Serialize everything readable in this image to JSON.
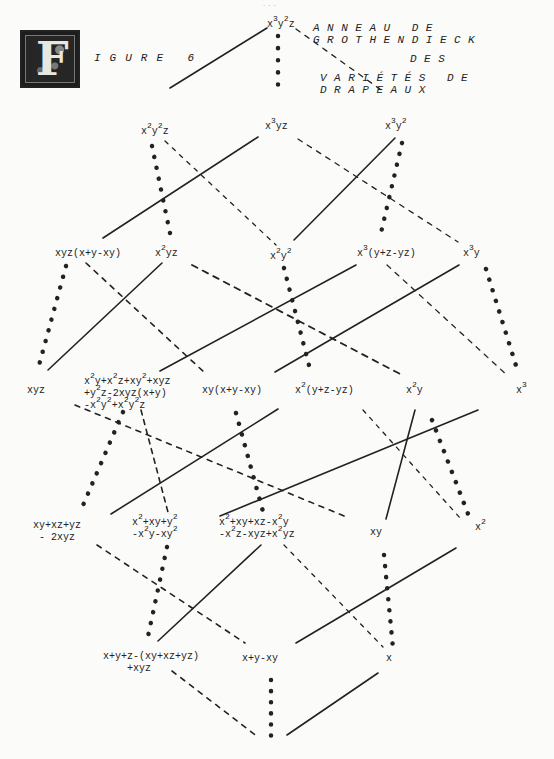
{
  "page_number": "...",
  "figure": {
    "initial_letter": "F",
    "label": "IGURE 6",
    "title_lines": [
      "ANNEAU DE GROTHENDIECK",
      "DES",
      "VARIÉTÉS DE DRAPEAUX"
    ]
  },
  "legend_styles": {
    "solid": "solid line",
    "dashed": "dashed line",
    "starred": "star-dotted line"
  },
  "nodes": [
    {
      "id": "n0",
      "row": 0,
      "label": "x³y²z"
    },
    {
      "id": "n1a",
      "row": 1,
      "label": "x²y²z"
    },
    {
      "id": "n1b",
      "row": 1,
      "label": "x³yz"
    },
    {
      "id": "n1c",
      "row": 1,
      "label": "x³y²"
    },
    {
      "id": "n2a",
      "row": 2,
      "label": "xyz(x+y-xy)"
    },
    {
      "id": "n2b",
      "row": 2,
      "label": "x²yz"
    },
    {
      "id": "n2c",
      "row": 2,
      "label": "x²y²"
    },
    {
      "id": "n2d",
      "row": 2,
      "label": "x³(y+z-yz)"
    },
    {
      "id": "n2e",
      "row": 2,
      "label": "x³y"
    },
    {
      "id": "n3a",
      "row": 3,
      "label": "xyz"
    },
    {
      "id": "n3b",
      "row": 3,
      "label": "x²y+x²z+xy²+xyz +y²z-2xyz(x+y) -x²y²+x²y²z"
    },
    {
      "id": "n3c",
      "row": 3,
      "label": "xy(x+y-xy)"
    },
    {
      "id": "n3d",
      "row": 3,
      "label": "x²(y+z-yz)"
    },
    {
      "id": "n3e",
      "row": 3,
      "label": "x²y"
    },
    {
      "id": "n3f",
      "row": 3,
      "label": "x³"
    },
    {
      "id": "n4a",
      "row": 4,
      "label": "xy+xz+yz - 2xyz"
    },
    {
      "id": "n4b",
      "row": 4,
      "label": "x²+xy+y² -x²y-xy²"
    },
    {
      "id": "n4c",
      "row": 4,
      "label": "x²+xy+xz-x²y -x²z-xyz+x²yz"
    },
    {
      "id": "n4d",
      "row": 4,
      "label": "xy"
    },
    {
      "id": "n4e",
      "row": 4,
      "label": "x²"
    },
    {
      "id": "n5a",
      "row": 5,
      "label": "x+y+z-(xy+xz+yz) +xyz"
    },
    {
      "id": "n5b",
      "row": 5,
      "label": "x+y-xy"
    },
    {
      "id": "n5c",
      "row": 5,
      "label": "x"
    },
    {
      "id": "n6",
      "row": 6,
      "label": ""
    }
  ],
  "edges": [
    {
      "from": "n0",
      "to": "n1a",
      "style": "solid"
    },
    {
      "from": "n0",
      "to": "n1b",
      "style": "starred"
    },
    {
      "from": "n0",
      "to": "n1c",
      "style": "dashed"
    },
    {
      "from": "n1a",
      "to": "n2b",
      "style": "starred"
    },
    {
      "from": "n1a",
      "to": "n2c",
      "style": "dashed"
    },
    {
      "from": "n1b",
      "to": "n2a",
      "style": "solid"
    },
    {
      "from": "n1b",
      "to": "n2e",
      "style": "dashed"
    },
    {
      "from": "n1c",
      "to": "n2c",
      "style": "solid"
    },
    {
      "from": "n1c",
      "to": "n2d",
      "style": "starred"
    },
    {
      "from": "n2a",
      "to": "n3a",
      "style": "starred"
    },
    {
      "from": "n2a",
      "to": "n3c",
      "style": "dashed"
    },
    {
      "from": "n2b",
      "to": "n3a",
      "style": "solid"
    },
    {
      "from": "n2b",
      "to": "n3e",
      "style": "dashed"
    },
    {
      "from": "n2c",
      "to": "n3d",
      "style": "starred"
    },
    {
      "from": "n2d",
      "to": "n3b",
      "style": "solid"
    },
    {
      "from": "n2d",
      "to": "n3f",
      "style": "dashed"
    },
    {
      "from": "n2e",
      "to": "n3d",
      "style": "solid"
    },
    {
      "from": "n2e",
      "to": "n3f",
      "style": "starred"
    },
    {
      "from": "n3b",
      "to": "n4a",
      "style": "starred"
    },
    {
      "from": "n3b",
      "to": "n4b",
      "style": "dashed"
    },
    {
      "from": "n3b",
      "to": "n4d",
      "style": "dashed"
    },
    {
      "from": "n3c",
      "to": "n4a",
      "style": "solid"
    },
    {
      "from": "n3c",
      "to": "n4c",
      "style": "starred"
    },
    {
      "from": "n3d",
      "to": "n4e",
      "style": "dashed"
    },
    {
      "from": "n3e",
      "to": "n4d",
      "style": "solid"
    },
    {
      "from": "n3f",
      "to": "n4c",
      "style": "solid"
    },
    {
      "from": "n3f",
      "to": "n4e",
      "style": "starred"
    },
    {
      "from": "n4a",
      "to": "n5b",
      "style": "dashed"
    },
    {
      "from": "n4b",
      "to": "n5a",
      "style": "starred"
    },
    {
      "from": "n4c",
      "to": "n5a",
      "style": "solid"
    },
    {
      "from": "n4c",
      "to": "n5c",
      "style": "dashed"
    },
    {
      "from": "n4d",
      "to": "n5c",
      "style": "starred"
    },
    {
      "from": "n4e",
      "to": "n5b",
      "style": "solid"
    },
    {
      "from": "n5a",
      "to": "n6",
      "style": "dashed"
    },
    {
      "from": "n5b",
      "to": "n6",
      "style": "starred"
    },
    {
      "from": "n5c",
      "to": "n6",
      "style": "solid"
    }
  ]
}
